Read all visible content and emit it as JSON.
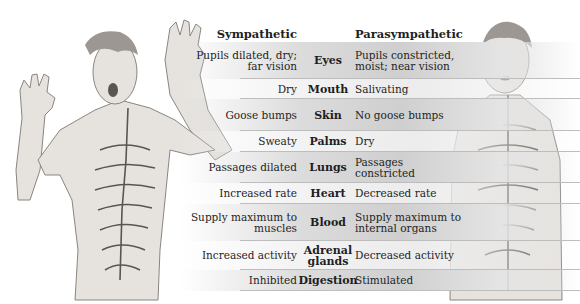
{
  "headers": {
    "sympathetic": "Sympathetic",
    "organ": "",
    "parasympathetic": "Parasympathetic"
  },
  "rows": [
    {
      "organ": "Eyes",
      "sympathetic": "Pupils dilated, dry; far vision",
      "parasympathetic": "Pupils constricted, moist; near vision",
      "shade": "shade",
      "top": 22,
      "height": 37
    },
    {
      "organ": "Mouth",
      "sympathetic": "Dry",
      "parasympathetic": "Salivating",
      "shade": "light",
      "top": 59,
      "height": 20
    },
    {
      "organ": "Skin",
      "sympathetic": "Goose bumps",
      "parasympathetic": "No goose bumps",
      "shade": "shade",
      "top": 79,
      "height": 32
    },
    {
      "organ": "Palms",
      "sympathetic": "Sweaty",
      "parasympathetic": "Dry",
      "shade": "light",
      "top": 111,
      "height": 21
    },
    {
      "organ": "Lungs",
      "sympathetic": "Passages dilated",
      "parasympathetic": "Passages constricted",
      "shade": "shade",
      "top": 132,
      "height": 31
    },
    {
      "organ": "Heart",
      "sympathetic": "Increased rate",
      "parasympathetic": "Decreased rate",
      "shade": "light",
      "top": 163,
      "height": 21
    },
    {
      "organ": "Blood",
      "sympathetic": "Supply maximum to muscles",
      "parasympathetic": "Supply maximum to internal organs",
      "shade": "shade",
      "top": 184,
      "height": 37
    },
    {
      "organ": "Adrenal glands",
      "sympathetic": "Increased activity",
      "parasympathetic": "Decreased activity",
      "shade": "light",
      "top": 221,
      "height": 29
    },
    {
      "organ": "Digestion",
      "sympathetic": "Inhibited",
      "parasympathetic": "Stimulated",
      "shade": "shade",
      "top": 250,
      "height": 21
    }
  ],
  "figures": {
    "left": "startled-man-sympathetic-nervous-system",
    "right": "calm-man-parasympathetic-nervous-system"
  }
}
